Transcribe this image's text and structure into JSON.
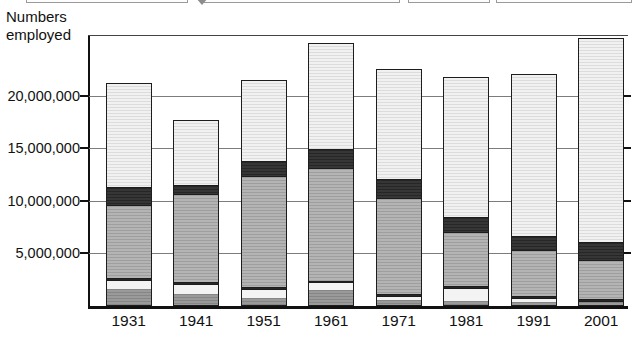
{
  "axis_title": "Numbers\nemployed",
  "legend": {
    "boxes": [
      "legend-box-1",
      "legend-box-2",
      "legend-box-3",
      "legend-box-4"
    ],
    "marker": "down-triangle-icon"
  },
  "chart_data": {
    "type": "bar",
    "subtype": "stacked",
    "title": "",
    "xlabel": "",
    "ylabel": "Numbers employed",
    "ylim": [
      0,
      25800000
    ],
    "grid": true,
    "legend_position": "top-cropped",
    "categories": [
      "1931",
      "1941",
      "1951",
      "1961",
      "1971",
      "1981",
      "1991",
      "2001"
    ],
    "ytick_values": [
      5000000,
      10000000,
      15000000,
      20000000
    ],
    "ytick_labels": [
      "5,000,000",
      "10,000,000",
      "15,000,000",
      "20,000,000"
    ],
    "series": [
      {
        "name": "agriculture",
        "color": "#8f8f8f",
        "values": [
          1500000,
          1050000,
          700000,
          1450000,
          450000,
          400000,
          300000,
          250000
        ]
      },
      {
        "name": "mining-energy",
        "color": "#f3f3f3",
        "values": [
          900000,
          950000,
          850000,
          700000,
          400000,
          1200000,
          400000,
          150000
        ]
      },
      {
        "name": "construction",
        "color": "#2d2d2d",
        "values": [
          180000,
          170000,
          170000,
          180000,
          180000,
          170000,
          170000,
          170000
        ]
      },
      {
        "name": "manufacturing",
        "color": "#a8a8a8",
        "values": [
          6900000,
          8400000,
          10600000,
          10700000,
          9150000,
          5200000,
          4400000,
          3700000
        ]
      },
      {
        "name": "transport-utilities",
        "color": "#2d2d2d",
        "values": [
          1750000,
          900000,
          1400000,
          1800000,
          1800000,
          1400000,
          1300000,
          1700000
        ]
      },
      {
        "name": "services",
        "color": "#e4e4e4",
        "values": [
          10000000,
          6200000,
          7800000,
          10200000,
          10550000,
          13400000,
          15500000,
          19550000
        ]
      }
    ],
    "totals": [
      21230000,
      17670000,
      21520000,
      25030000,
      22530000,
      21770000,
      22070000,
      25520000
    ]
  },
  "colors": {
    "axis": "#111111",
    "grid": "#7c7c7c",
    "background": "#ffffff",
    "bar_outline": "#1d1d1d"
  }
}
